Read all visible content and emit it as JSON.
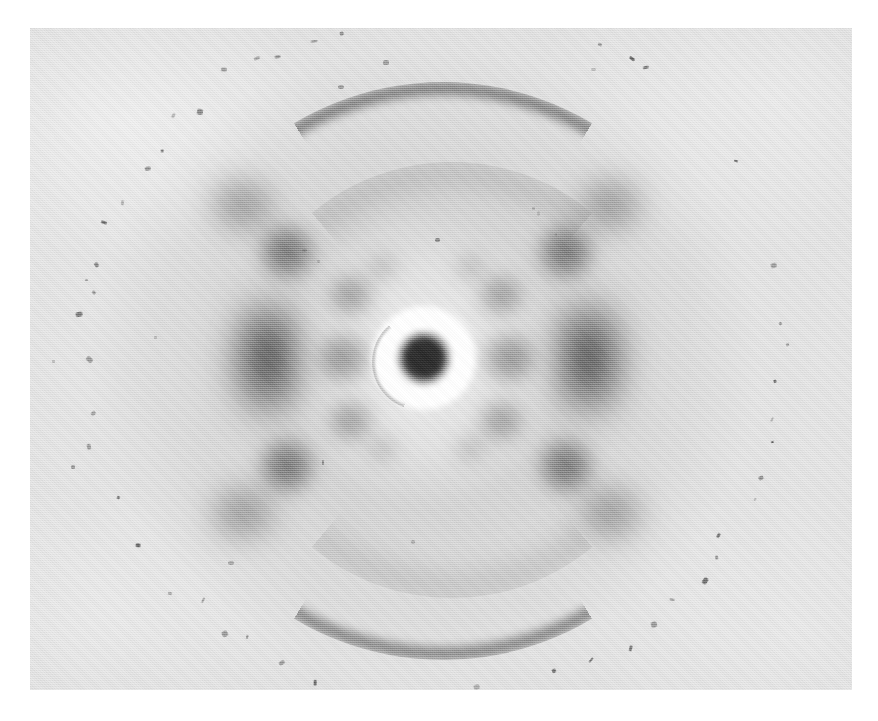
{
  "image": {
    "title": "Photo 51",
    "subject": "X-ray diffraction photograph of the B form of sodium deoxyribose nucleate (DNA) fibre",
    "media_type": "halftone reproduction of a photographic plate",
    "canvas": {
      "width": 878,
      "height": 721,
      "background_color": "#ffffff"
    },
    "print": {
      "left": 30,
      "top": 28,
      "width": 822,
      "height": 662,
      "border": "white paper margin on all four sides",
      "base_tone": "#dedede",
      "texture": "halftone dot screen, visible grain"
    },
    "alt_text": "A grey X-ray diffraction photograph showing a characteristic X-shaped pattern of fuzzy dark spots radiating from a bright, over-exposed central beam stop, with strong dark smudges at left and right on the equator and dark horizontal arcs at the top and bottom of the frame."
  },
  "chart_data": {
    "type": "scatter",
    "subtitle": "",
    "xlabel": "",
    "ylabel": "",
    "grid": false,
    "legend": null,
    "axis_units": "pixels of the reproduced print",
    "pattern_description": "Helical cross (X) diffraction pattern: layer lines 1-4 above and below the equator forming the arms of an X; layer line 4 absent on the meridian; strong meridional arcs corresponding to the 3.4 angstrom base stacking at the top and bottom of the frame.",
    "beam_center": {
      "x": 424,
      "y": 358
    },
    "beam_stop": {
      "label": "beam stop / direct beam",
      "white_halo_radius": 52,
      "dark_core_radius": 24,
      "dark_core_color": "#2a2a2a",
      "halo_color": "#ffffff"
    },
    "features": [
      {
        "name": "central-dark-spot",
        "x": 424,
        "y": 358,
        "rx": 24,
        "ry": 24,
        "darkness": 1.0,
        "kind": "spot"
      },
      {
        "name": "equator-spot-left-1",
        "x": 345,
        "y": 358,
        "rx": 26,
        "ry": 24,
        "darkness": 0.74,
        "kind": "spot"
      },
      {
        "name": "equator-spot-right-1",
        "x": 508,
        "y": 358,
        "rx": 26,
        "ry": 24,
        "darkness": 0.74,
        "kind": "spot"
      },
      {
        "name": "equator-band-left-2",
        "x": 268,
        "y": 358,
        "rx": 34,
        "ry": 56,
        "darkness": 0.9,
        "kind": "band"
      },
      {
        "name": "equator-band-right-2",
        "x": 589,
        "y": 358,
        "rx": 34,
        "ry": 56,
        "darkness": 0.9,
        "kind": "band"
      },
      {
        "name": "layer1-left-upper",
        "x": 352,
        "y": 296,
        "rx": 22,
        "ry": 20,
        "darkness": 0.6,
        "kind": "spot"
      },
      {
        "name": "layer1-right-upper",
        "x": 500,
        "y": 296,
        "rx": 22,
        "ry": 20,
        "darkness": 0.6,
        "kind": "spot"
      },
      {
        "name": "layer1-left-lower",
        "x": 352,
        "y": 420,
        "rx": 22,
        "ry": 20,
        "darkness": 0.6,
        "kind": "spot"
      },
      {
        "name": "layer1-right-lower",
        "x": 500,
        "y": 420,
        "rx": 22,
        "ry": 20,
        "darkness": 0.6,
        "kind": "spot"
      },
      {
        "name": "layer2-left-upper",
        "x": 287,
        "y": 252,
        "rx": 27,
        "ry": 27,
        "darkness": 0.68,
        "kind": "spot"
      },
      {
        "name": "layer2-right-upper",
        "x": 566,
        "y": 252,
        "rx": 27,
        "ry": 27,
        "darkness": 0.68,
        "kind": "spot"
      },
      {
        "name": "layer2-left-lower",
        "x": 287,
        "y": 466,
        "rx": 27,
        "ry": 27,
        "darkness": 0.68,
        "kind": "spot"
      },
      {
        "name": "layer2-right-lower",
        "x": 566,
        "y": 466,
        "rx": 27,
        "ry": 27,
        "darkness": 0.68,
        "kind": "spot"
      },
      {
        "name": "layer3-left-upper",
        "x": 243,
        "y": 205,
        "rx": 32,
        "ry": 26,
        "darkness": 0.52,
        "kind": "smudge"
      },
      {
        "name": "layer3-right-upper",
        "x": 610,
        "y": 205,
        "rx": 32,
        "ry": 26,
        "darkness": 0.52,
        "kind": "smudge"
      },
      {
        "name": "layer3-left-lower",
        "x": 243,
        "y": 513,
        "rx": 32,
        "ry": 26,
        "darkness": 0.52,
        "kind": "smudge"
      },
      {
        "name": "layer3-right-lower",
        "x": 610,
        "y": 513,
        "rx": 32,
        "ry": 26,
        "darkness": 0.52,
        "kind": "smudge"
      },
      {
        "name": "inner-layer1-left",
        "x": 383,
        "y": 268,
        "rx": 14,
        "ry": 13,
        "darkness": 0.36,
        "kind": "spot"
      },
      {
        "name": "inner-layer1-right",
        "x": 470,
        "y": 268,
        "rx": 14,
        "ry": 13,
        "darkness": 0.36,
        "kind": "spot"
      },
      {
        "name": "inner-layer1-left-lo",
        "x": 383,
        "y": 448,
        "rx": 14,
        "ry": 13,
        "darkness": 0.36,
        "kind": "spot"
      },
      {
        "name": "inner-layer1-right-lo",
        "x": 470,
        "y": 448,
        "rx": 14,
        "ry": 13,
        "darkness": 0.36,
        "kind": "spot"
      }
    ],
    "arcs": [
      {
        "name": "meridional-arc-top",
        "cx": 430,
        "cy": 358,
        "radius": 276,
        "span_deg": 62,
        "orientation": "top",
        "thickness": 13,
        "darkness": 0.62,
        "assignment": "3.4 angstrom base-stacking reflection"
      },
      {
        "name": "meridional-arc-bottom",
        "cx": 430,
        "cy": 358,
        "radius": 276,
        "span_deg": 62,
        "orientation": "bottom",
        "thickness": 13,
        "darkness": 0.58,
        "assignment": "3.4 angstrom base-stacking reflection"
      },
      {
        "name": "inner-diffuse-arc-top",
        "cx": 430,
        "cy": 358,
        "radius": 196,
        "span_deg": 80,
        "orientation": "top",
        "thickness": 22,
        "darkness": 0.22,
        "assignment": "diffuse halo boundary"
      },
      {
        "name": "inner-diffuse-arc-bottom",
        "cx": 430,
        "cy": 358,
        "radius": 196,
        "span_deg": 80,
        "orientation": "bottom",
        "thickness": 22,
        "darkness": 0.2,
        "assignment": "diffuse halo boundary"
      }
    ],
    "halo": {
      "name": "diffuse-scattering-halo",
      "cx": 424,
      "cy": 358,
      "rx": 340,
      "ry": 312,
      "description": "broad elliptical cloud of diffuse scatter surrounding the pattern"
    },
    "speck_ring": {
      "name": "dust-speck-ring",
      "cx": 432,
      "cy": 352,
      "radius": 352,
      "description": "faint ring of small dark dust specks / emulsion flaws tracing a large circle near the edge of the print",
      "count": 68
    }
  }
}
